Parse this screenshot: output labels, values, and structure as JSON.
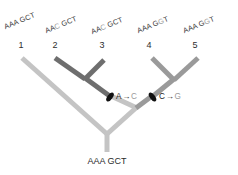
{
  "figure": {
    "root": {
      "label": "AAA GCT"
    },
    "tips": [
      {
        "number": "1",
        "sequence_prefix": "AAA GCT",
        "sequence_mut": "",
        "sequence_suffix": "",
        "full_sequence": "AAA GCT",
        "branch_color": "#c4c4c4"
      },
      {
        "number": "2",
        "sequence_prefix": "AA",
        "sequence_mut": "C",
        "sequence_suffix": " GCT",
        "full_sequence": "AAC GCT",
        "branch_color": "#6e6e6e"
      },
      {
        "number": "3",
        "sequence_prefix": "AA",
        "sequence_mut": "C",
        "sequence_suffix": " GCT",
        "full_sequence": "AAC GCT",
        "branch_color": "#6e6e6e"
      },
      {
        "number": "4",
        "sequence_prefix": "AAA G",
        "sequence_mut": "G",
        "sequence_suffix": "T",
        "full_sequence": "AAA GGT",
        "branch_color": "#9a9a9a"
      },
      {
        "number": "5",
        "sequence_prefix": "AAA G",
        "sequence_mut": "G",
        "sequence_suffix": "T",
        "full_sequence": "AAA GGT",
        "branch_color": "#9a9a9a"
      }
    ],
    "mutations": [
      {
        "from": "A",
        "arrow": "→",
        "to": "C",
        "marker": "black-lozenge",
        "label": "A→C"
      },
      {
        "from": "C",
        "arrow": "→",
        "to": "G",
        "marker": "black-lozenge",
        "label": "C→G"
      }
    ],
    "colors": {
      "light_branch": "#c4c4c4",
      "mid_branch": "#9a9a9a",
      "dark_branch": "#6e6e6e",
      "marker": "#111111",
      "text": "#2b2b2b",
      "muted_text": "#9a9a9a"
    }
  }
}
